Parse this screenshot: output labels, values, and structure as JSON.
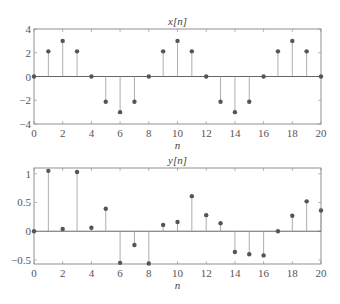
{
  "chart_data": [
    {
      "type": "stem",
      "title": "x[n]",
      "xlabel": "n",
      "ylabel": "",
      "xlim": [
        0,
        20
      ],
      "ylim": [
        -4,
        4
      ],
      "xticks": [
        0,
        2,
        4,
        6,
        8,
        10,
        12,
        14,
        16,
        18,
        20
      ],
      "yticks": [
        -4,
        -2,
        0,
        2,
        4
      ],
      "ytick_labels": [
        "−4",
        "−2",
        "0",
        "2",
        "4"
      ],
      "grid": false,
      "x": [
        0,
        1,
        2,
        3,
        4,
        5,
        6,
        7,
        8,
        9,
        10,
        11,
        12,
        13,
        14,
        15,
        16,
        17,
        18,
        19,
        20
      ],
      "values": [
        0,
        2.12,
        3,
        2.12,
        0,
        -2.12,
        -3,
        -2.12,
        0,
        2.12,
        3,
        2.12,
        0,
        -2.12,
        -3,
        -2.12,
        0,
        2.12,
        3,
        2.12,
        0
      ]
    },
    {
      "type": "stem",
      "title": "y[n]",
      "xlabel": "n",
      "ylabel": "",
      "xlim": [
        0,
        20
      ],
      "ylim": [
        -0.57,
        1.1
      ],
      "xticks": [
        0,
        2,
        4,
        6,
        8,
        10,
        12,
        14,
        16,
        18,
        20
      ],
      "yticks": [
        -0.5,
        0,
        0.5,
        1
      ],
      "ytick_labels": [
        "−0.5",
        "0",
        "0.5",
        "1"
      ],
      "grid": false,
      "x": [
        0,
        1,
        2,
        3,
        4,
        5,
        6,
        7,
        8,
        9,
        10,
        11,
        12,
        13,
        14,
        15,
        16,
        17,
        18,
        19,
        20
      ],
      "values": [
        0,
        1.05,
        0.04,
        1.03,
        0.06,
        0.39,
        -0.55,
        -0.24,
        -0.56,
        0.11,
        0.16,
        0.61,
        0.28,
        0.14,
        -0.36,
        -0.4,
        -0.42,
        0,
        0.27,
        0.52,
        0.36
      ]
    }
  ]
}
